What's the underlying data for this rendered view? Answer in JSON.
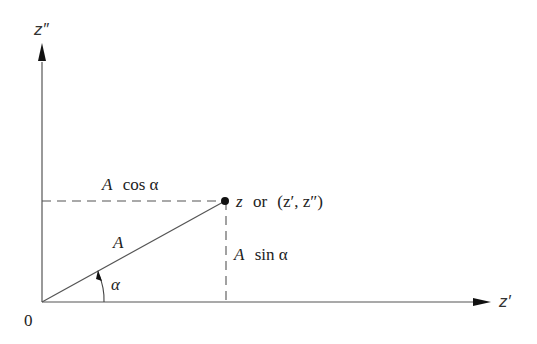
{
  "diagram": {
    "type": "phasor-components",
    "axes": {
      "vertical_label": "z″",
      "horizontal_label": "z′",
      "origin_label": "0"
    },
    "point": {
      "label_z": "z",
      "label_or": "or",
      "label_coords": "(z′, z″)"
    },
    "vector": {
      "magnitude_label": "A"
    },
    "angle": {
      "label": "α"
    },
    "projections": {
      "horizontal": {
        "A": "A",
        "fn": "cos α"
      },
      "vertical": {
        "A": "A",
        "fn": "sin α"
      }
    },
    "colors": {
      "line": "#555555",
      "text": "#222222"
    }
  }
}
